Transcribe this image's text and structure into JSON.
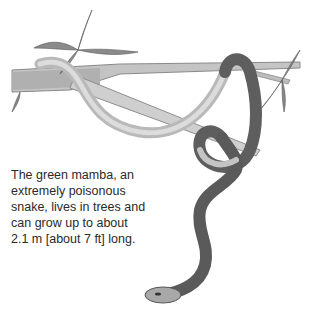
{
  "illustration": {
    "subject": "green mamba on tree branch",
    "colors": {
      "branch": "#bdbdbd",
      "snake_back": "#5a5a5a",
      "snake_belly": "#c8c8c8",
      "leaf": "#7a7a7a"
    }
  },
  "caption": {
    "lines": [
      "The green mamba, an",
      "extremely poisonous",
      "snake, lives in trees and",
      "can grow up to about",
      "2.1 m [about 7 ft] long."
    ]
  }
}
